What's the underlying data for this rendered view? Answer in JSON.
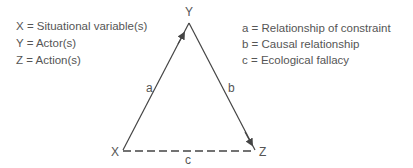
{
  "legend_left": [
    {
      "symbol": "X",
      "eq": "=",
      "meaning": "Situational variable(s)"
    },
    {
      "symbol": "Y",
      "eq": "=",
      "meaning": "Actor(s)"
    },
    {
      "symbol": "Z",
      "eq": "=",
      "meaning": "Action(s)"
    }
  ],
  "legend_right": [
    {
      "symbol": "a",
      "eq": "=",
      "meaning": "Relationship of constraint"
    },
    {
      "symbol": "b",
      "eq": "=",
      "meaning": "Causal relationship"
    },
    {
      "symbol": "c",
      "eq": "=",
      "meaning": "Ecological fallacy"
    }
  ],
  "diagram": {
    "nodes": {
      "x": "X",
      "y": "Y",
      "z": "Z"
    },
    "edges": {
      "a": {
        "label": "a",
        "from": "X",
        "to": "Y",
        "style": "solid-arrow"
      },
      "b": {
        "label": "b",
        "from": "Y",
        "to": "Z",
        "style": "solid-arrow"
      },
      "c": {
        "label": "c",
        "from": "X",
        "to": "Z",
        "style": "dashed"
      }
    },
    "line_color": "#444444"
  }
}
